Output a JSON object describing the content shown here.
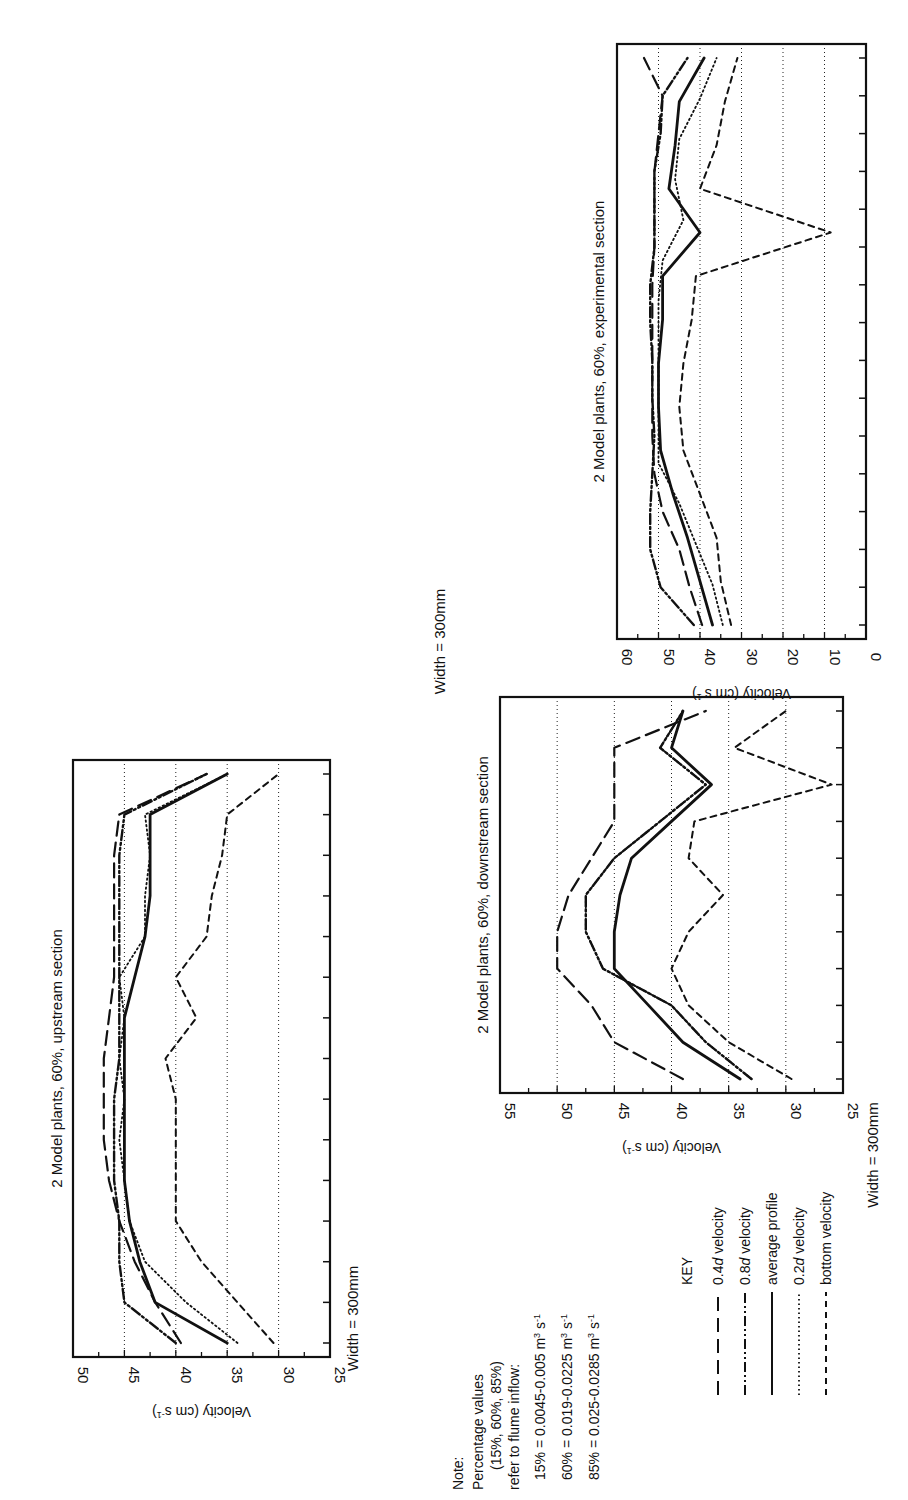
{
  "figure": {
    "legend": {
      "title": "KEY",
      "entries": [
        {
          "key": "v04",
          "label_pre": "0.4",
          "label_italic": "d",
          "label_post": " velocity",
          "style": "long-dash"
        },
        {
          "key": "v08",
          "label_pre": "0.8",
          "label_italic": "d",
          "label_post": " velocity",
          "style": "dash-dot-dot"
        },
        {
          "key": "avg",
          "label_pre": "average profile",
          "label_italic": "",
          "label_post": "",
          "style": "solid"
        },
        {
          "key": "v02",
          "label_pre": "0.2",
          "label_italic": "d",
          "label_post": " velocity",
          "style": "dotted"
        },
        {
          "key": "bottom",
          "label_pre": "bottom velocity",
          "label_italic": "",
          "label_post": "",
          "style": "short-dash"
        }
      ]
    },
    "note": {
      "heading": "Note:",
      "lines": [
        "Percentage values",
        "(15%, 60%, 85%)",
        "refer to flume inflow:"
      ],
      "flows": [
        {
          "pct": "15% = 0.0045-0.005 m",
          "exp": "3",
          "unit": " s",
          "unit_exp": "-1"
        },
        {
          "pct": "60% = 0.019-0.0225 m",
          "exp": "3",
          "unit": " s",
          "unit_exp": "-1"
        },
        {
          "pct": "85% = 0.025-0.0285 m",
          "exp": "3",
          "unit": " s",
          "unit_exp": "-1"
        }
      ]
    }
  },
  "chart_data": [
    {
      "id": "upstream",
      "type": "line",
      "title": "2 Model plants, 60%, upstream section",
      "xlabel": "Width = 300mm",
      "ylabel": "Velocity (cm s",
      "ylabel_sup": "-1",
      "ylabel_end": ")",
      "ylim": [
        25,
        50
      ],
      "yticks": [
        25,
        30,
        35,
        40,
        45,
        50
      ],
      "gridlines": [
        30,
        35,
        40,
        45
      ],
      "n_points": 15,
      "series": [
        {
          "name": "0.4d velocity",
          "key": "v04",
          "values": [
            39.5,
            42,
            44,
            45.5,
            46.5,
            47,
            47,
            47,
            46.5,
            46,
            46,
            46,
            46,
            45.5,
            37
          ]
        },
        {
          "name": "0.8d velocity",
          "key": "v08",
          "values": [
            40,
            45,
            45.5,
            45.5,
            46,
            46,
            46,
            45.5,
            45.5,
            45.5,
            45.5,
            45.5,
            45.5,
            45,
            37
          ]
        },
        {
          "name": "average profile",
          "key": "avg",
          "values": [
            35,
            42,
            43.5,
            44.5,
            45,
            45,
            45,
            45,
            45,
            44,
            43,
            42.5,
            42.5,
            42.5,
            35
          ]
        },
        {
          "name": "0.2d velocity",
          "key": "v02",
          "values": [
            34,
            39,
            43,
            44.5,
            45,
            45.5,
            45,
            45.5,
            45,
            45.5,
            43,
            43,
            42.5,
            43,
            35
          ]
        },
        {
          "name": "bottom velocity",
          "key": "bottom",
          "values": [
            30.5,
            34,
            37.5,
            40,
            40,
            40,
            40,
            41,
            38,
            40,
            37,
            36.5,
            35.5,
            35,
            30
          ]
        }
      ]
    },
    {
      "id": "experimental",
      "type": "line",
      "title": "2 Model plants, 60%, experimental section",
      "xlabel": "Width = 300mm",
      "ylabel": "Velocity (cm s",
      "ylabel_sup": "-1",
      "ylabel_end": ")",
      "ylim": [
        0,
        60
      ],
      "yticks": [
        0,
        10,
        20,
        30,
        40,
        50,
        60
      ],
      "gridlines": [
        10,
        20,
        30,
        40,
        50
      ],
      "n_points": 16,
      "series": [
        {
          "name": "0.4d velocity",
          "key": "v04",
          "values": [
            39.5,
            42.5,
            45,
            49,
            51,
            51.5,
            51.5,
            51.5,
            51.5,
            51.5,
            51,
            51,
            51,
            50,
            49,
            53.5
          ]
        },
        {
          "name": "0.8d velocity",
          "key": "v08",
          "values": [
            41.5,
            49.5,
            52,
            52,
            51.5,
            51,
            51.5,
            51.5,
            52,
            52,
            51,
            51,
            51,
            49.5,
            49,
            43
          ]
        },
        {
          "name": "average profile",
          "key": "avg",
          "values": [
            37,
            40,
            43,
            46.5,
            49.5,
            50,
            50,
            49,
            49,
            40,
            47.5,
            46,
            45,
            39
          ]
        },
        {
          "name": "0.2d velocity",
          "key": "v02",
          "values": [
            34.5,
            37,
            41,
            45,
            50,
            50,
            50,
            50,
            50,
            49,
            44,
            46,
            45,
            40,
            36
          ]
        },
        {
          "name": "bottom velocity",
          "key": "bottom",
          "values": [
            32.5,
            35,
            36,
            40,
            44,
            45,
            44,
            42,
            41,
            8.5,
            40,
            36,
            34,
            31
          ]
        }
      ]
    },
    {
      "id": "downstream",
      "type": "line",
      "title": "2 Model plants, 60%, downstream section",
      "xlabel": "Width = 300mm",
      "ylabel": "Velocity (cm s",
      "ylabel_sup": "-1",
      "ylabel_end": ")",
      "ylim": [
        25,
        55
      ],
      "yticks": [
        25,
        30,
        35,
        40,
        45,
        50,
        55
      ],
      "gridlines": [
        30,
        35,
        40,
        45,
        50
      ],
      "n_points": 11,
      "series": [
        {
          "name": "0.4d velocity",
          "key": "v04",
          "values": [
            39,
            45,
            47,
            50,
            50,
            49,
            47,
            45,
            45,
            45,
            37
          ]
        },
        {
          "name": "0.8d velocity",
          "key": "v08",
          "values": [
            33,
            37,
            40,
            46,
            47.5,
            47.5,
            45,
            41,
            37,
            41,
            39
          ]
        },
        {
          "name": "average profile",
          "key": "avg",
          "values": [
            34,
            39,
            42,
            45,
            45,
            44.5,
            43.5,
            40,
            36.5,
            40,
            39
          ]
        },
        {
          "name": "0.2d velocity",
          "key": "v02",
          "values": [
            33,
            37,
            40,
            46,
            47.5,
            47.5,
            45,
            41,
            37,
            41,
            39
          ]
        },
        {
          "name": "bottom velocity",
          "key": "bottom",
          "values": [
            29.5,
            35,
            38.5,
            40,
            38.5,
            35.5,
            38.5,
            38,
            26,
            34.5,
            30
          ]
        }
      ]
    }
  ]
}
